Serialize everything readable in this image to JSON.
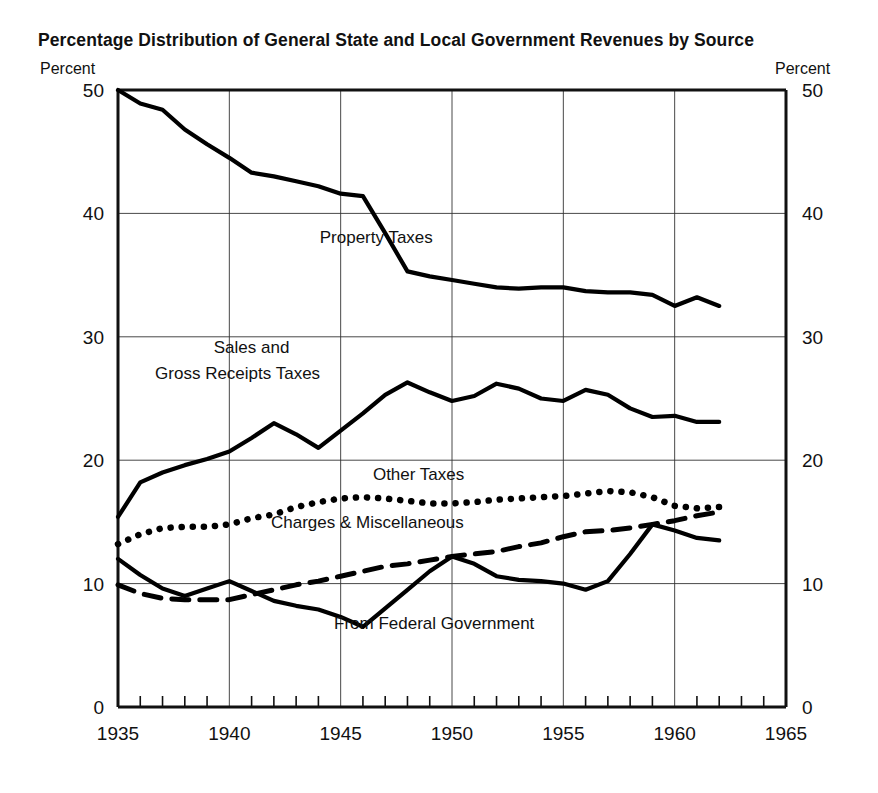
{
  "chart_data": {
    "type": "line",
    "title": "Percentage Distribution of General State and Local Government Revenues by Source",
    "xlabel": "",
    "ylabel": "Percent",
    "ylabel_right": "Percent",
    "xlim": [
      1935,
      1965
    ],
    "ylim": [
      0,
      50
    ],
    "x_ticks": [
      1935,
      1940,
      1945,
      1950,
      1955,
      1960,
      1965
    ],
    "y_ticks": [
      0,
      10,
      20,
      30,
      40,
      50
    ],
    "y_ticks_right": [
      0,
      10,
      20,
      30,
      40,
      50
    ],
    "grid": true,
    "minor_x_tick_interval": 1,
    "legend_position": "inline-annotations",
    "series": [
      {
        "name": "Property Taxes",
        "style": "solid",
        "label_x": 1946.6,
        "label_y": 37.6,
        "x": [
          1935,
          1936,
          1937,
          1938,
          1939,
          1940,
          1941,
          1942,
          1943,
          1944,
          1945,
          1946,
          1947,
          1948,
          1949,
          1950,
          1951,
          1952,
          1953,
          1954,
          1955,
          1956,
          1957,
          1958,
          1959,
          1960,
          1961,
          1962
        ],
        "values": [
          50.0,
          48.9,
          48.4,
          46.8,
          45.6,
          44.5,
          43.3,
          43.0,
          42.6,
          42.2,
          41.6,
          41.4,
          38.4,
          35.3,
          34.9,
          34.6,
          34.3,
          34.0,
          33.9,
          34.0,
          34.0,
          33.7,
          33.6,
          33.6,
          33.4,
          32.5,
          33.2,
          32.5
        ]
      },
      {
        "name": "Sales and Gross Receipts Taxes",
        "style": "solid",
        "label_line1": "Sales and",
        "label_line2": "Gross Receipts Taxes",
        "label_x": 1941.0,
        "label_y": 28.7,
        "x": [
          1935,
          1936,
          1937,
          1938,
          1939,
          1940,
          1941,
          1942,
          1943,
          1944,
          1945,
          1946,
          1947,
          1948,
          1949,
          1950,
          1951,
          1952,
          1953,
          1954,
          1955,
          1956,
          1957,
          1958,
          1959,
          1960,
          1961,
          1962
        ],
        "values": [
          15.4,
          18.2,
          19.0,
          19.6,
          20.1,
          20.7,
          21.8,
          23.0,
          22.1,
          21.0,
          22.4,
          23.8,
          25.3,
          26.3,
          25.5,
          24.8,
          25.2,
          26.2,
          25.8,
          25.0,
          24.8,
          25.7,
          25.3,
          24.2,
          23.5,
          23.6,
          23.1,
          23.1
        ]
      },
      {
        "name": "Other Taxes",
        "style": "dotted",
        "label_x": 1948.5,
        "label_y": 18.4,
        "x": [
          1935,
          1936,
          1937,
          1938,
          1939,
          1940,
          1941,
          1942,
          1943,
          1944,
          1945,
          1946,
          1947,
          1948,
          1949,
          1950,
          1951,
          1952,
          1953,
          1954,
          1955,
          1956,
          1957,
          1958,
          1959,
          1960,
          1961,
          1962
        ],
        "values": [
          13.2,
          14.0,
          14.5,
          14.6,
          14.6,
          14.8,
          15.3,
          15.6,
          16.2,
          16.6,
          16.9,
          17.0,
          16.9,
          16.7,
          16.5,
          16.5,
          16.6,
          16.8,
          16.9,
          17.0,
          17.1,
          17.3,
          17.5,
          17.4,
          17.0,
          16.3,
          16.1,
          16.2
        ]
      },
      {
        "name": "Charges & Miscellaneous",
        "style": "dashed",
        "label_x": 1946.2,
        "label_y": 14.5,
        "x": [
          1935,
          1936,
          1937,
          1938,
          1939,
          1940,
          1941,
          1942,
          1943,
          1944,
          1945,
          1946,
          1947,
          1948,
          1949,
          1950,
          1951,
          1952,
          1953,
          1954,
          1955,
          1956,
          1957,
          1958,
          1959,
          1960,
          1961,
          1962
        ],
        "values": [
          9.9,
          9.2,
          8.8,
          8.7,
          8.7,
          8.7,
          9.1,
          9.5,
          9.9,
          10.2,
          10.6,
          11.0,
          11.4,
          11.6,
          11.9,
          12.2,
          12.4,
          12.6,
          13.0,
          13.3,
          13.8,
          14.2,
          14.3,
          14.5,
          14.8,
          15.1,
          15.5,
          15.8
        ]
      },
      {
        "name": "From Federal Government",
        "style": "solid",
        "label_x": 1949.2,
        "label_y": 6.3,
        "x": [
          1935,
          1936,
          1937,
          1938,
          1939,
          1940,
          1941,
          1942,
          1943,
          1944,
          1945,
          1946,
          1947,
          1948,
          1949,
          1950,
          1951,
          1952,
          1953,
          1954,
          1955,
          1956,
          1957,
          1958,
          1959,
          1960,
          1961,
          1962
        ],
        "values": [
          12.0,
          10.7,
          9.6,
          9.0,
          9.6,
          10.2,
          9.4,
          8.6,
          8.2,
          7.9,
          7.3,
          6.5,
          8.0,
          9.5,
          11.0,
          12.2,
          11.6,
          10.6,
          10.3,
          10.2,
          10.0,
          9.5,
          10.2,
          12.4,
          14.8,
          14.3,
          13.7,
          13.5
        ]
      }
    ]
  },
  "axis": {
    "unit_left": "Percent",
    "unit_right": "Percent"
  }
}
